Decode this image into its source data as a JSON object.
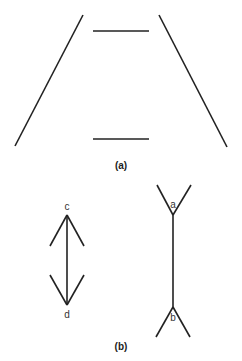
{
  "figure": {
    "part_a": {
      "caption": "(a)",
      "description": "Ponzo illusion: two converging lines with two equal horizontal segments"
    },
    "part_b": {
      "caption": "(b)",
      "description": "Müller-Lyer illusion: two equal-length shafts with inward and outward fins",
      "labels": {
        "c": "c",
        "d": "d",
        "a": "a",
        "b": "b"
      }
    },
    "colors": {
      "stroke": "#222222",
      "label": "#333333",
      "background": "#ffffff"
    }
  }
}
